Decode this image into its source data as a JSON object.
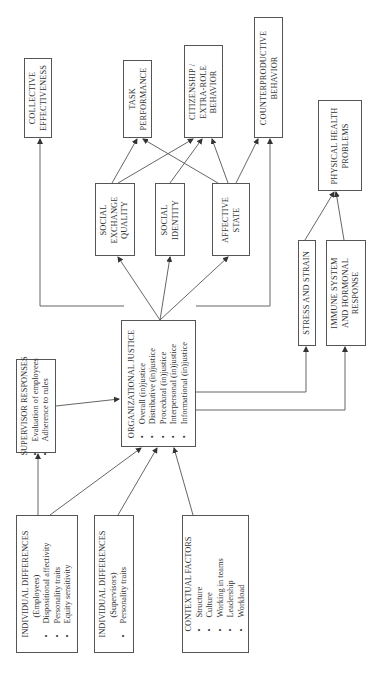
{
  "diagram": {
    "orientation": "rotated-90-ccw",
    "outcomes": {
      "collective_effectiveness": [
        "COLLECTIVE",
        "EFFECTIVENESS"
      ],
      "task_performance": [
        "TASK",
        "PERFORMANCE"
      ],
      "citizenship": [
        "CITIZENSHIP /",
        "EXTRA-ROLE",
        "BEHAVIOR"
      ],
      "counterproductive": [
        "COUNTERPRODUCTIVE",
        "BEHAVIOR"
      ],
      "physical_health": [
        "PHYSICAL HEALTH",
        "PROBLEMS"
      ]
    },
    "mediators": {
      "social_exchange": [
        "SOCIAL",
        "EXCHANGE",
        "QUALITY"
      ],
      "social_identity": [
        "SOCIAL",
        "IDENTITY"
      ],
      "affective_state": [
        "AFFECTIVE",
        "STATE"
      ],
      "stress_strain": [
        "STRESS AND STRAIN"
      ],
      "immune_system": [
        "IMMUNE SYSTEM",
        "AND HORMONAL",
        "RESPONSE"
      ]
    },
    "org_justice": {
      "title": "ORGANIZATIONAL JUSTICE",
      "items": [
        "Overall (in)justice",
        "Distributive (in)justice",
        "Procedural (in)justice",
        "Interpersonal (in)justice",
        "Informational (in)justice"
      ]
    },
    "supervisor_responses": {
      "title": "SUPERVISOR RESPONSES",
      "items": [
        "Evaluation of employees",
        "Adherence to rules"
      ]
    },
    "indiv_diff_employees": {
      "title": "INDIVIDUAL DIFFERENCES",
      "subtitle": "(Employees)",
      "items": [
        "Dispositional affectivity",
        "Personality traits",
        "Equity sensitivity"
      ]
    },
    "indiv_diff_supervisors": {
      "title": "INDIVIDUAL DIFFERENCES",
      "subtitle": "(Supervisors)",
      "items": [
        "Personality traits"
      ]
    },
    "contextual_factors": {
      "title": "CONTEXTUAL FACTORS",
      "items": [
        "Structure",
        "Culture",
        "Working in teams",
        "Leadership",
        "Workload"
      ]
    }
  }
}
